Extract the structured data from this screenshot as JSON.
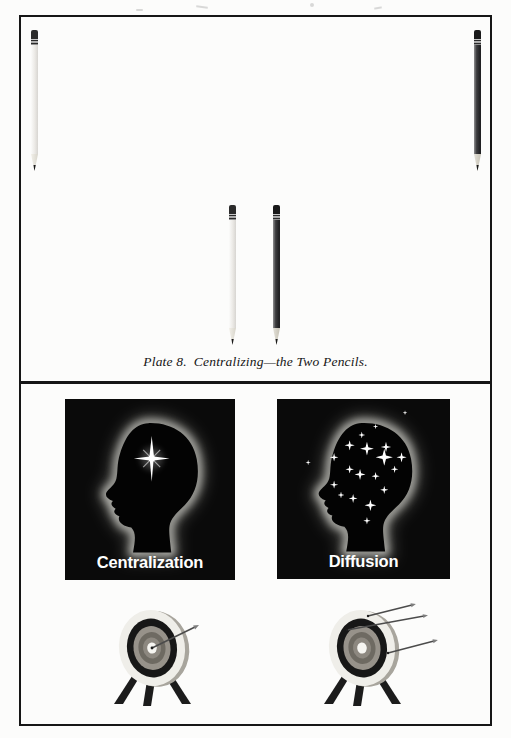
{
  "plate": {
    "caption": "Plate 8. Centralizing—the Two Pencils.",
    "pencils": [
      {
        "id": "top-left",
        "variant": "light"
      },
      {
        "id": "top-right",
        "variant": "dark"
      },
      {
        "id": "mid-left",
        "variant": "light"
      },
      {
        "id": "mid-right",
        "variant": "dark"
      }
    ]
  },
  "concepts": {
    "left": {
      "label": "Centralization",
      "star_count": 1
    },
    "right": {
      "label": "Diffusion",
      "star_count": 20
    }
  },
  "targets": {
    "left": {
      "arrows": 1
    },
    "right": {
      "arrows": 3
    }
  },
  "colors": {
    "frame": "#161616",
    "card_background": "#0a0a0a",
    "glow": "#cfcfc9",
    "label_text": "#ffffff"
  },
  "illustrations": {
    "centralization_star": {
      "x": 51,
      "y": 34.5
    },
    "diffusion_stars": [
      [
        42,
        27,
        3
      ],
      [
        52,
        29,
        4
      ],
      [
        63,
        28,
        3
      ],
      [
        49,
        21,
        2
      ],
      [
        33,
        34,
        2.5
      ],
      [
        62,
        34,
        5
      ],
      [
        72,
        34,
        3
      ],
      [
        68,
        41,
        2.2
      ],
      [
        42,
        41,
        2.5
      ],
      [
        48,
        44,
        3.2
      ],
      [
        57,
        45,
        2.4
      ],
      [
        33,
        50,
        2.4
      ],
      [
        37,
        56,
        2
      ],
      [
        44,
        58,
        2.6
      ],
      [
        54,
        62,
        3.4
      ],
      [
        62,
        53,
        2.4
      ],
      [
        52,
        71,
        2.2
      ],
      [
        18,
        37,
        1.6
      ],
      [
        74,
        8,
        1.4
      ],
      [
        57,
        16,
        1.6
      ]
    ]
  }
}
